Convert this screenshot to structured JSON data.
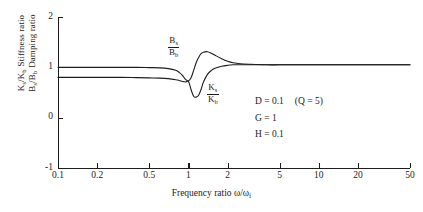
{
  "chart_data": {
    "type": "line",
    "title": "",
    "xlabel": "Frequency ratio ω/ω",
    "xlabel_sub": "f",
    "ylabel_line1_main": "K",
    "ylabel_line1_sub1": "s",
    "ylabel_line1_mid": "/K",
    "ylabel_line1_sub2": "b",
    "ylabel_line1_text": "Stiffness  ratio",
    "ylabel_line2_main": "B",
    "ylabel_line2_sub1": "s",
    "ylabel_line2_mid": "/B",
    "ylabel_line2_sub2": "b",
    "ylabel_line2_text": "Damping  ratio",
    "xscale": "log",
    "xlim": [
      0.1,
      50
    ],
    "ylim": [
      -1,
      2
    ],
    "grid": false,
    "legend": "inline-curve-labels",
    "xticks": [
      0.1,
      0.2,
      0.5,
      1,
      2,
      5,
      10,
      20,
      50
    ],
    "xticklabels": [
      "0.1",
      "0.2",
      "0.5",
      "1",
      "2",
      "5",
      "10",
      "20",
      "50"
    ],
    "yticks": [
      -1,
      0,
      1,
      2
    ],
    "yticklabels": [
      "-1",
      "0",
      "1",
      "2"
    ],
    "series": [
      {
        "name": "Bs/Bb",
        "label_numerator": "B",
        "label_numerator_sub": "s",
        "label_denominator": "B",
        "label_denominator_sub": "b",
        "description": "Damping ratio",
        "x": [
          0.1,
          0.15,
          0.2,
          0.3,
          0.4,
          0.5,
          0.6,
          0.7,
          0.8,
          0.85,
          0.9,
          0.95,
          1.0,
          1.05,
          1.1,
          1.15,
          1.2,
          1.25,
          1.3,
          1.4,
          1.5,
          1.6,
          1.8,
          2.0,
          2.2,
          2.5,
          3.0,
          4.0,
          5.0,
          7.0,
          10.0,
          20.0,
          30.0,
          50.0
        ],
        "y": [
          1.0,
          1.0,
          1.0,
          1.0,
          1.0,
          0.995,
          0.99,
          0.975,
          0.94,
          0.9,
          0.84,
          0.76,
          0.73,
          0.8,
          0.95,
          1.1,
          1.2,
          1.27,
          1.3,
          1.31,
          1.28,
          1.24,
          1.17,
          1.12,
          1.09,
          1.07,
          1.06,
          1.05,
          1.05,
          1.05,
          1.05,
          1.05,
          1.05,
          1.05
        ]
      },
      {
        "name": "Ks/Kb",
        "label_numerator": "K",
        "label_numerator_sub": "s",
        "label_denominator": "K",
        "label_denominator_sub": "b",
        "description": "Stiffness ratio",
        "x": [
          0.1,
          0.15,
          0.2,
          0.3,
          0.4,
          0.5,
          0.6,
          0.7,
          0.8,
          0.85,
          0.9,
          0.95,
          1.0,
          1.05,
          1.1,
          1.15,
          1.2,
          1.25,
          1.3,
          1.4,
          1.5,
          1.6,
          1.8,
          2.0,
          2.2,
          2.5,
          3.0,
          4.0,
          5.0,
          7.0,
          10.0,
          20.0,
          30.0,
          50.0
        ],
        "y": [
          0.8,
          0.8,
          0.8,
          0.8,
          0.795,
          0.79,
          0.785,
          0.775,
          0.755,
          0.74,
          0.72,
          0.71,
          0.72,
          0.55,
          0.42,
          0.41,
          0.45,
          0.56,
          0.7,
          0.86,
          0.94,
          0.98,
          1.02,
          1.04,
          1.05,
          1.05,
          1.05,
          1.05,
          1.05,
          1.05,
          1.05,
          1.05,
          1.05,
          1.05
        ]
      }
    ],
    "annotations": [
      {
        "text": "D = 0.1",
        "extra": "(Q = 5)"
      },
      {
        "text": "G = 1",
        "extra": ""
      },
      {
        "text": "H = 0.1",
        "extra": ""
      }
    ]
  },
  "annotations": {
    "d_line": "D = 0.1",
    "q_line": "(Q = 5)",
    "g_line": "G = 1",
    "h_line": "H = 0.1"
  },
  "colors": {
    "curve": "#1c1c1c",
    "axis": "#1c1c1c",
    "background": "#ffffff"
  }
}
